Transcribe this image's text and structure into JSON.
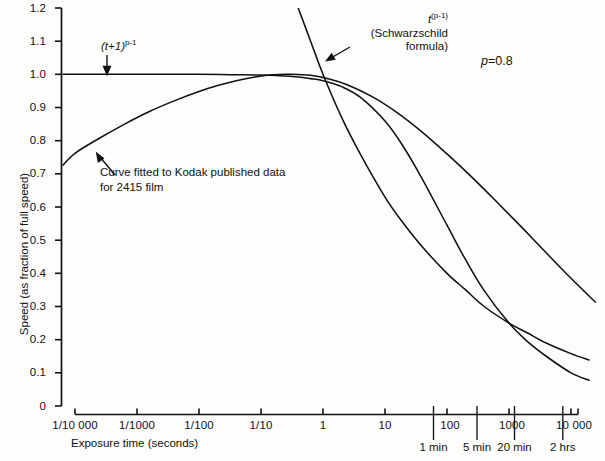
{
  "chart_data": {
    "type": "line",
    "title": "",
    "xlabel": "Exposure time (seconds)",
    "ylabel": "Speed (as fraction of full speed)",
    "x_scale": "log10",
    "xlim_log": [
      -4.2,
      4.6
    ],
    "ylim": [
      0,
      1.2
    ],
    "grid": false,
    "legend": "none",
    "y_ticks": [
      "1.2",
      "1.1",
      "1.0",
      "0.9",
      "0.8",
      "0.7",
      "0.6",
      "0.5",
      "0.4",
      "0.3",
      "0.2",
      "0.1",
      "0"
    ],
    "y_tick_values": [
      1.2,
      1.1,
      1.0,
      0.9,
      0.8,
      0.7,
      0.6,
      0.5,
      0.4,
      0.3,
      0.2,
      0.1,
      0
    ],
    "x_ticks": [
      {
        "label": "1/10 000",
        "log_value": -4
      },
      {
        "label": "1/1000",
        "log_value": -3
      },
      {
        "label": "1/100",
        "log_value": -2
      },
      {
        "label": "1/10",
        "log_value": -1
      },
      {
        "label": "1",
        "log_value": 0
      },
      {
        "label": "10",
        "log_value": 1
      },
      {
        "label": "100",
        "log_value": 2
      },
      {
        "label": "1000",
        "log_value": 3
      },
      {
        "label": "10 000",
        "log_value": 4
      }
    ],
    "time_marks": [
      {
        "label": "1 min",
        "seconds": 60,
        "log_value": 1.778
      },
      {
        "label": "5 min",
        "seconds": 300,
        "log_value": 2.477
      },
      {
        "label": "20 min",
        "seconds": 1200,
        "log_value": 3.079
      },
      {
        "label": "2 hrs",
        "seconds": 7200,
        "log_value": 3.857
      }
    ],
    "parameter": {
      "name": "p",
      "value": 0.8,
      "display": "p=0.8"
    },
    "series": [
      {
        "name": "(t+1)^(p-1)",
        "annotation": "(t+1)<sup>p-1</sup>",
        "formula": "(t+1)^(p-1)",
        "points_log_t": [
          -4.2,
          -4,
          -3,
          -2,
          -1.5,
          -1,
          -0.7,
          -0.4,
          -0.2,
          0,
          0.3,
          0.6,
          1,
          1.3,
          1.6,
          2,
          2.3,
          2.6,
          3,
          3.3,
          3.6,
          4,
          4.3,
          4.6
        ],
        "values": [
          1.0,
          1.0,
          1.0,
          1.0,
          0.999,
          0.998,
          0.996,
          0.992,
          0.987,
          0.981,
          0.963,
          0.931,
          0.859,
          0.781,
          0.685,
          0.545,
          0.441,
          0.348,
          0.25,
          0.194,
          0.15,
          0.1,
          0.077,
          0.06
        ]
      },
      {
        "name": "t^(p-1) (Schwarzschild formula)",
        "annotation": "t<sup>(p-1)</sup>",
        "annotation_line2": "(Schwarzschild",
        "annotation_line3": "formula)",
        "formula": "t^(p-1)",
        "points_log_t": [
          -0.65,
          -0.4,
          -0.2,
          0,
          0.3,
          0.6,
          1,
          1.3,
          1.6,
          2,
          2.3,
          2.6,
          3,
          3.3,
          3.6,
          4,
          4.3,
          4.6
        ],
        "values": [
          1.35,
          1.2,
          1.1,
          1.0,
          0.87,
          0.76,
          0.63,
          0.55,
          0.48,
          0.4,
          0.35,
          0.3,
          0.25,
          0.22,
          0.19,
          0.158,
          0.138,
          0.12
        ]
      },
      {
        "name": "Curve fitted to Kodak published data for 2415 film",
        "annotation_line1": "Curve fitted to Kodak published data",
        "annotation_line2": "for 2415 film",
        "points_log_t": [
          -4.2,
          -4.0,
          -3.6,
          -3.2,
          -2.8,
          -2.4,
          -2.0,
          -1.7,
          -1.4,
          -1.1,
          -0.8,
          -0.5,
          -0.2,
          0.1,
          0.4,
          0.8,
          1.2,
          1.6,
          2.0,
          2.4,
          2.8,
          3.2,
          3.6,
          4.0,
          4.4,
          4.65
        ],
        "values": [
          0.725,
          0.762,
          0.808,
          0.85,
          0.888,
          0.92,
          0.948,
          0.966,
          0.981,
          0.992,
          0.999,
          1.0,
          0.997,
          0.986,
          0.968,
          0.932,
          0.884,
          0.826,
          0.76,
          0.69,
          0.616,
          0.54,
          0.462,
          0.385,
          0.312,
          0.268
        ]
      }
    ]
  },
  "annotations": {
    "curve1_label": "(t+1)",
    "curve1_exp": "p-1",
    "curve2_label": "t",
    "curve2_exp": "(p-1)",
    "curve2_line2": "(Schwarzschild",
    "curve2_line3": "formula)",
    "kodak_line1": "Curve fitted to Kodak published data",
    "kodak_line2": "for 2415 film",
    "p_symbol": "p",
    "p_equals": "=0.8"
  },
  "axes": {
    "y_title": "Speed (as fraction of full speed)",
    "x_title": "Exposure time (seconds)"
  },
  "colors": {
    "line": "#111111",
    "axis": "#111111",
    "background": "#fdfdfc"
  }
}
